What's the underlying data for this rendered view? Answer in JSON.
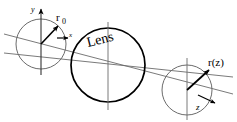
{
  "figure": {
    "name": "gaussian-beam-through-lens-diagram",
    "background_color": "#ffffff",
    "stroke_color_thin": "#6b6b6b",
    "stroke_color_bold": "#000000",
    "text_color": "#000000",
    "width": 237,
    "height": 122
  },
  "labels": {
    "y_axis": "y",
    "x_axis": "x",
    "z_axis": "z",
    "r_zero": "r",
    "r_zero_sub": "0",
    "lens": "Lens",
    "r_of_z": "r(z)"
  },
  "shapes": {
    "input_beam_circle": {
      "cx": 41,
      "cy": 44,
      "r": 25
    },
    "lens_circle": {
      "cx": 108,
      "cy": 65,
      "r": 37
    },
    "output_beam_circle": {
      "cx": 187,
      "cy": 90,
      "r": 25
    },
    "propagation_axis": {
      "x1": 4,
      "y1": 38,
      "x2": 233,
      "y2": 97
    }
  },
  "vectors": {
    "r_zero_vector": {
      "from_x": 41,
      "from_y": 44,
      "to_x": 59,
      "to_y": 25
    },
    "r_of_z_vector": {
      "from_x": 187,
      "from_y": 90,
      "to_x": 210,
      "to_y": 70
    }
  }
}
